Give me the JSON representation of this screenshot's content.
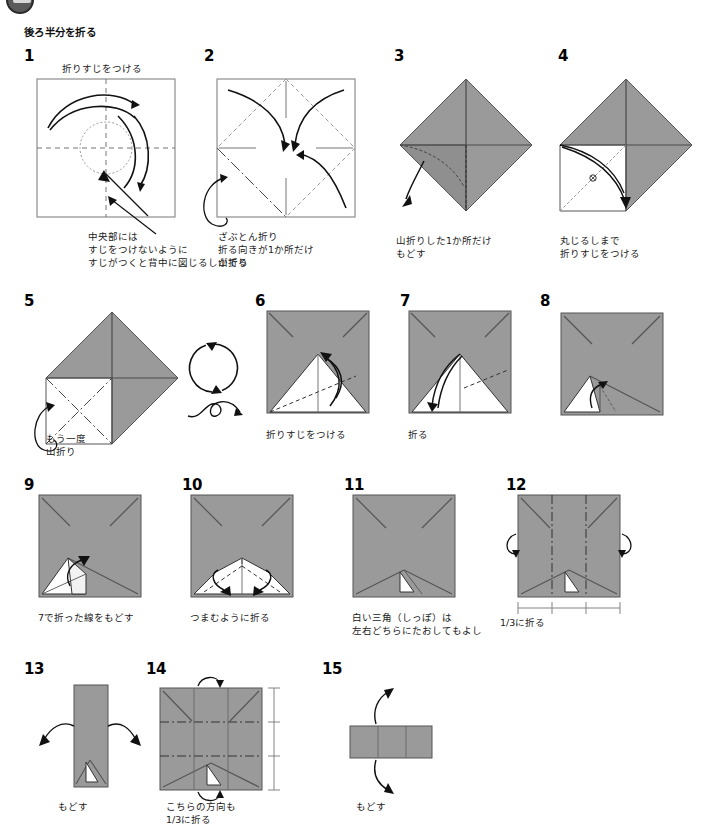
{
  "page": {
    "heading": "後ろ半分を折る",
    "paper_gray": "#9a9a9a",
    "paper_gray_dark": "#8c8c8c",
    "line_color": "#1a1a1a",
    "white": "#ffffff"
  },
  "badge": {
    "name": "page-corner-stamp"
  },
  "steps": [
    {
      "number": "1",
      "top_caption": "折りすじをつける",
      "caption": "中央部には\nすじをつけないように\nすじがつくと背中に図じるしがでる",
      "figure": "square-crease-circle"
    },
    {
      "number": "2",
      "top_caption": "",
      "caption": "ざぶとん折り\n折る向きが1か所だけ\n山折り",
      "figure": "square-cushion-fold"
    },
    {
      "number": "3",
      "top_caption": "",
      "caption": "山折りした1か所だけ\nもどす",
      "figure": "diamond-unfold"
    },
    {
      "number": "4",
      "top_caption": "",
      "caption": "丸じるしまで\n折りすじをつける",
      "figure": "diamond-crease-to-mark"
    },
    {
      "number": "5",
      "top_caption": "",
      "caption": "もう一度\n山折り",
      "figure": "diamond-mountain-again"
    },
    {
      "number": "6",
      "top_caption": "",
      "caption": "折りすじをつける",
      "figure": "gray-square-white-triangle-crease"
    },
    {
      "number": "7",
      "top_caption": "",
      "caption": "折る",
      "figure": "gray-square-white-triangle-fold"
    },
    {
      "number": "8",
      "top_caption": "",
      "caption": "",
      "figure": "gray-square-small-flap"
    },
    {
      "number": "9",
      "top_caption": "",
      "caption": "7で折った線をもどす",
      "figure": "gray-square-unfold-line"
    },
    {
      "number": "10",
      "top_caption": "",
      "caption": "つまむように折る",
      "figure": "gray-square-pinch-fold"
    },
    {
      "number": "11",
      "top_caption": "",
      "caption": "白い三角（しっぽ）は\n左右どちらにたおしてもよし",
      "figure": "gray-square-tail"
    },
    {
      "number": "12",
      "top_caption": "",
      "caption": "1/3に折る",
      "figure": "gray-square-thirds-vertical"
    },
    {
      "number": "13",
      "top_caption": "",
      "caption": "もどす",
      "figure": "narrow-strip-unfold"
    },
    {
      "number": "14",
      "top_caption": "",
      "caption": "こちらの方向も\n1/3に折る",
      "figure": "gray-square-thirds-horizontal"
    },
    {
      "number": "15",
      "top_caption": "",
      "caption": "もどす",
      "figure": "horizontal-strip-unfold"
    }
  ],
  "symbols": {
    "rotate": "rotate-arrow-circle",
    "flip": "flip-over-loop"
  }
}
